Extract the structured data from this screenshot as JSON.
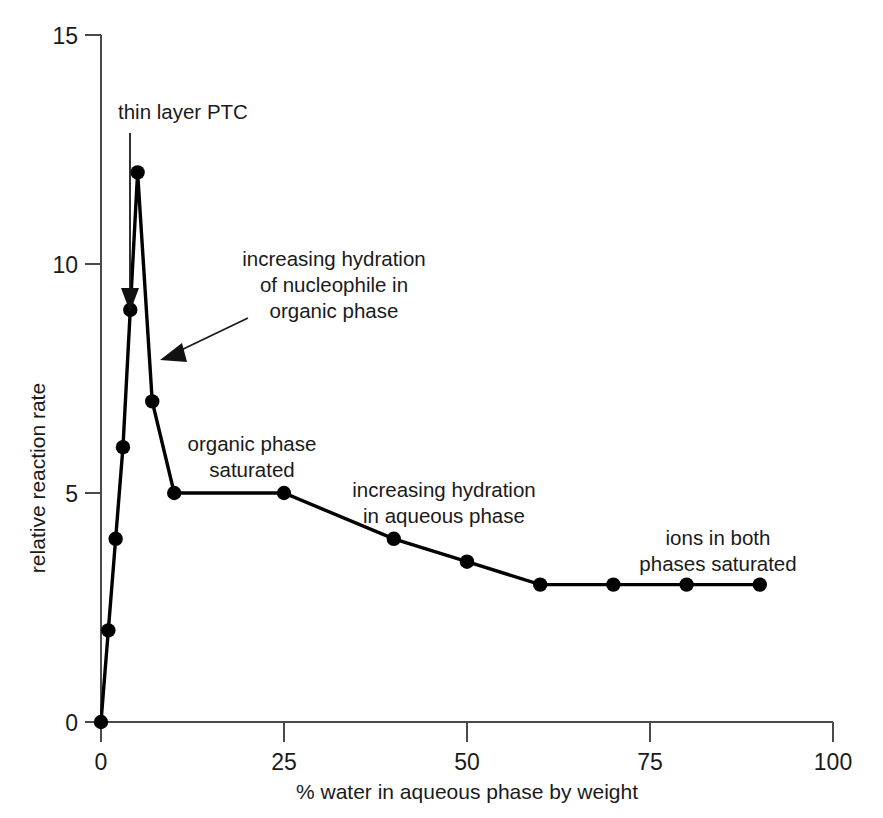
{
  "chart_data": {
    "type": "line",
    "title": "",
    "xlabel": "% water in aqueous phase by weight",
    "ylabel": "relative reaction rate",
    "xlim": [
      0,
      100
    ],
    "ylim": [
      0,
      15
    ],
    "xticks": [
      0,
      25,
      50,
      75,
      100
    ],
    "yticks": [
      0,
      5,
      10,
      15
    ],
    "xtick_labels": [
      "0",
      "25",
      "50",
      "75",
      "100"
    ],
    "ytick_labels": [
      "0",
      "5",
      "10",
      "15"
    ],
    "grid": false,
    "legend": false,
    "markers": "filled-circle",
    "series": [
      {
        "name": "relative reaction rate",
        "x": [
          0,
          1,
          2,
          3,
          4,
          5,
          7,
          10,
          25,
          40,
          50,
          60,
          70,
          80,
          90
        ],
        "y": [
          0,
          2,
          4,
          6,
          9,
          12,
          7,
          5,
          5,
          4,
          3.5,
          3,
          3,
          3,
          3
        ]
      }
    ],
    "annotations": [
      {
        "id": "thin-layer-ptc",
        "text": "thin layer PTC",
        "lines": [
          "thin layer PTC"
        ],
        "align": "left",
        "text_x": 118,
        "text_y": 119,
        "arrow_from": [
          130,
          130
        ],
        "arrow_to": [
          130,
          307
        ]
      },
      {
        "id": "increasing-hydration-organic",
        "text": "increasing hydration of nucleophile in organic phase",
        "lines": [
          "increasing hydration",
          "of nucleophile in",
          "organic phase"
        ],
        "align": "center",
        "text_x": 334,
        "text_y": 266,
        "arrow_from": [
          243,
          322
        ],
        "arrow_to": [
          160,
          360
        ]
      },
      {
        "id": "organic-phase-saturated",
        "text": "organic phase saturated",
        "lines": [
          "organic phase",
          "saturated"
        ],
        "align": "center",
        "text_x": 252,
        "text_y": 451,
        "arrow_from": null,
        "arrow_to": null
      },
      {
        "id": "increasing-hydration-aqueous",
        "text": "increasing hydration in aqueous phase",
        "lines": [
          "increasing hydration",
          "in aqueous phase"
        ],
        "align": "center",
        "text_x": 444,
        "text_y": 497,
        "arrow_from": null,
        "arrow_to": null
      },
      {
        "id": "ions-in-both-phases-saturated",
        "text": "ions in both phases saturated",
        "lines": [
          "ions in both",
          "phases saturated"
        ],
        "align": "center",
        "text_x": 718,
        "text_y": 545,
        "arrow_from": null,
        "arrow_to": null
      }
    ],
    "colors": {
      "line": "#000000",
      "marker": "#000000",
      "axis": "#4a4a4a",
      "text": "#1a1a1a",
      "background": "#ffffff"
    }
  },
  "axis": {
    "y_title": "relative reaction rate",
    "x_title": "% water in aqueous phase by weight",
    "y_labels": [
      "15",
      "10",
      "5",
      "0"
    ],
    "x_labels": [
      "0",
      "25",
      "50",
      "75",
      "100"
    ]
  },
  "annotation_text": {
    "thin_layer_ptc": "thin layer PTC",
    "increasing_hydration_organic_l1": "increasing hydration",
    "increasing_hydration_organic_l2": "of nucleophile in",
    "increasing_hydration_organic_l3": "organic phase",
    "organic_phase_saturated_l1": "organic phase",
    "organic_phase_saturated_l2": "saturated",
    "increasing_hydration_aqueous_l1": "increasing hydration",
    "increasing_hydration_aqueous_l2": "in aqueous phase",
    "ions_both_phases_l1": "ions in both",
    "ions_both_phases_l2": "phases saturated"
  }
}
